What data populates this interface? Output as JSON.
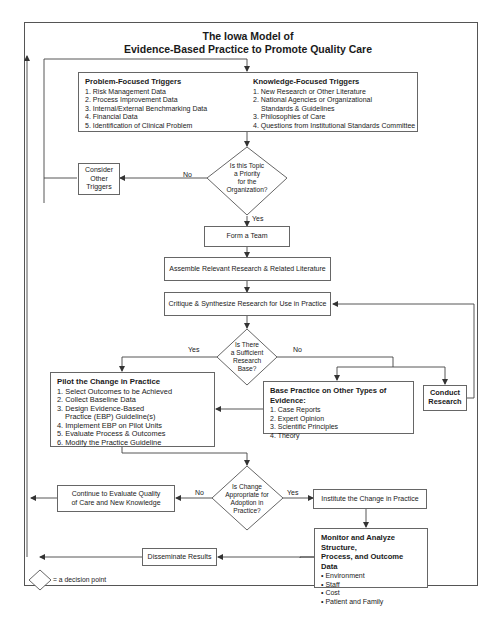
{
  "title": {
    "line1": "The Iowa Model of",
    "line2": "Evidence-Based Practice to Promote Quality Care"
  },
  "triggers": {
    "problem": {
      "heading": "Problem-Focused Triggers",
      "items": [
        "1. Risk Management Data",
        "2. Process Improvement Data",
        "3. Internal/External Benchmarking Data",
        "4. Financial Data",
        "5. Identification of Clinical Problem"
      ]
    },
    "knowledge": {
      "heading": "Knowledge-Focused Triggers",
      "items": [
        "1. New Research or Other Literature",
        "2. National Agencies or Organizational",
        "Standards & Guidelines",
        "3. Philosophies of Care",
        "4. Questions from Institutional Standards Committee"
      ]
    }
  },
  "decisions": {
    "priority": [
      "Is this Topic",
      "a Priority",
      "for the",
      "Organization?"
    ],
    "research_base": [
      "Is There",
      "a Sufficient",
      "Research",
      "Base?"
    ],
    "adoption": [
      "Is Change",
      "Appropriate for",
      "Adoption in",
      "Practice?"
    ]
  },
  "labels": {
    "yes": "Yes",
    "no": "No"
  },
  "steps": {
    "consider_other": [
      "Consider",
      "Other",
      "Triggers"
    ],
    "form_team": "Form a Team",
    "assemble": "Assemble Relevant Research & Related Literature",
    "critique": "Critique & Synthesize Research for Use in Practice",
    "conduct_research": [
      "Conduct",
      "Research"
    ],
    "continue_eval": [
      "Continue to Evaluate Quality",
      "of Care and New Knowledge"
    ],
    "institute": "Institute the Change in Practice",
    "disseminate": "Disseminate Results"
  },
  "pilot": {
    "heading": "Pilot the Change in Practice",
    "items": [
      "1. Select Outcomes to be Achieved",
      "2. Collect Baseline Data",
      "3. Design Evidence-Based",
      "Practice (EBP) Guideline(s)",
      "4. Implement EBP on Pilot Units",
      "5. Evaluate Process & Outcomes",
      "6. Modify the Practice Guideline"
    ]
  },
  "base_practice": {
    "heading": "Base Practice on Other Types of Evidence:",
    "items": [
      "1. Case Reports",
      "2. Expert Opinion",
      "3. Scientific Principles",
      "4. Theory"
    ]
  },
  "monitor": {
    "heading_line1": "Monitor and Analyze Structure,",
    "heading_line2": "Process, and Outcome Data",
    "items": [
      "• Environment",
      "• Staff",
      "• Cost",
      "• Patient and Family"
    ]
  },
  "legend": {
    "text": "= a decision point"
  },
  "colors": {
    "line": "#444444",
    "border": "#666666",
    "background": "#ffffff"
  }
}
